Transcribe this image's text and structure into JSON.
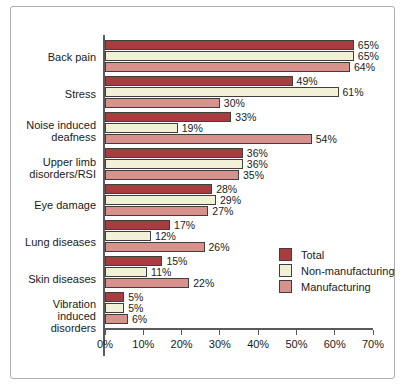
{
  "chart_data": {
    "type": "bar",
    "orientation": "horizontal",
    "title": "",
    "xlabel": "",
    "ylabel": "",
    "xlim": [
      0,
      70
    ],
    "x_ticks": [
      "0%",
      "10%",
      "20%",
      "30%",
      "40%",
      "50%",
      "60%",
      "70%"
    ],
    "grid": false,
    "legend_position": "right",
    "value_suffix": "%",
    "categories": [
      "Back pain",
      "Stress",
      "Noise induced deafness",
      "Upper limb disorders/RSI",
      "Eye damage",
      "Lung diseases",
      "Skin diseases",
      "Vibration induced disorders"
    ],
    "series": [
      {
        "name": "Total",
        "color": "#a83d3f",
        "values": [
          65,
          49,
          33,
          36,
          28,
          17,
          15,
          5
        ]
      },
      {
        "name": "Non-manufacturing",
        "color": "#f2f0d5",
        "values": [
          65,
          61,
          19,
          36,
          29,
          12,
          11,
          5
        ]
      },
      {
        "name": "Manufacturing",
        "color": "#d7928e",
        "values": [
          64,
          30,
          54,
          35,
          27,
          26,
          22,
          6
        ]
      }
    ]
  },
  "colors": {
    "bar_border": "#3f3f3f",
    "axis_line": "#5a5a5a",
    "frame_border": "#aeaeae",
    "text": "#1a1a1a",
    "background": "#ffffff"
  }
}
